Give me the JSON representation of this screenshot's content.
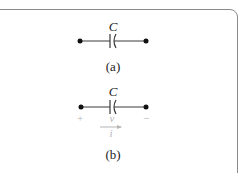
{
  "figure": {
    "circuits": [
      {
        "id": "a",
        "component_label": "C",
        "caption": "(a)"
      },
      {
        "id": "b",
        "component_label": "C",
        "voltage_plus": "+",
        "voltage_label": "v",
        "voltage_minus": "−",
        "current_label": "i",
        "caption": "(b)"
      }
    ],
    "colors": {
      "wire": "#3a3a3a",
      "frame": "#8a8a8a",
      "annotation": "#b5b5b5"
    }
  }
}
